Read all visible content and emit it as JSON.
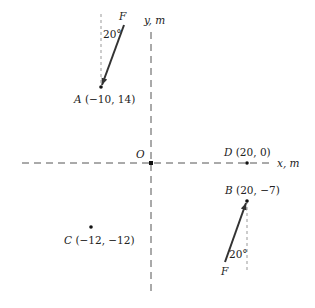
{
  "diagram": {
    "axes": {
      "x_label": "x, m",
      "y_label": "y, m",
      "origin_label": "O"
    },
    "points": {
      "A": {
        "name": "A",
        "coords": "(−10, 14)"
      },
      "B": {
        "name": "B",
        "coords": "(20, −7)"
      },
      "C": {
        "name": "C",
        "coords": "(−12, −12)"
      },
      "D": {
        "name": "D",
        "coords": "(20, 0)"
      }
    },
    "forces": {
      "at_A": {
        "label": "F",
        "angle": "20°"
      },
      "at_B": {
        "label": "F",
        "angle": "20°"
      }
    },
    "colors": {
      "axis": "#555555",
      "arrow": "#333333",
      "reference": "#999999"
    }
  }
}
